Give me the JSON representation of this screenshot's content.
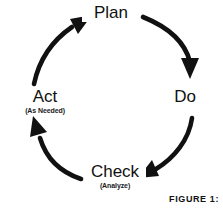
{
  "diagram": {
    "type": "cycle",
    "direction": "clockwise",
    "stroke_color": "#111111",
    "background_color": "#ffffff",
    "nodes": [
      {
        "id": "plan",
        "label": "Plan",
        "subtitle": "",
        "position": "top"
      },
      {
        "id": "do",
        "label": "Do",
        "subtitle": "",
        "position": "right"
      },
      {
        "id": "check",
        "label": "Check",
        "subtitle": "(Analyze)",
        "position": "bottom"
      },
      {
        "id": "act",
        "label": "Act",
        "subtitle": "(As Needed)",
        "position": "left"
      }
    ],
    "arrows": [
      {
        "id": "plan-to-do",
        "from": "Plan",
        "to": "Do",
        "icon": "curved-arrow-icon"
      },
      {
        "id": "do-to-check",
        "from": "Do",
        "to": "Check",
        "icon": "curved-arrow-icon"
      },
      {
        "id": "check-to-act",
        "from": "Check",
        "to": "Act",
        "icon": "curved-arrow-icon"
      },
      {
        "id": "act-to-plan",
        "from": "Act",
        "to": "Plan",
        "icon": "curved-arrow-icon"
      }
    ]
  },
  "caption": {
    "text": "FIGURE 1:"
  }
}
